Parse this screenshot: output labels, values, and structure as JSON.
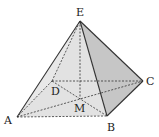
{
  "figure": {
    "type": "square pyramid",
    "points": {
      "E": {
        "x": 80,
        "y": 21
      },
      "A": {
        "x": 17,
        "y": 117
      },
      "B": {
        "x": 107,
        "y": 116
      },
      "C": {
        "x": 143,
        "y": 81
      },
      "D": {
        "x": 52,
        "y": 81
      },
      "M": {
        "x": 80,
        "y": 99
      }
    },
    "labels": {
      "E": "E",
      "A": "A",
      "B": "B",
      "C": "C",
      "D": "D",
      "M": "M"
    },
    "colors": {
      "front_face": "#e2e2e2",
      "right_face": "#c6c6c6",
      "edge": "#333333"
    }
  }
}
